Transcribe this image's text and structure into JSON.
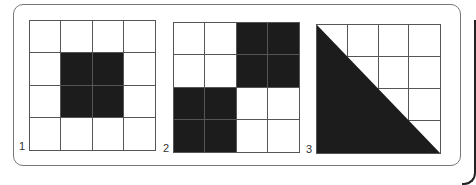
{
  "figures": [
    {
      "label": "1",
      "shaded": [
        [
          1,
          1
        ],
        [
          1,
          2
        ],
        [
          2,
          1
        ],
        [
          2,
          2
        ]
      ],
      "fill": "#1c1c1c"
    },
    {
      "label": "2",
      "shaded": [
        [
          0,
          2
        ],
        [
          0,
          3
        ],
        [
          1,
          2
        ],
        [
          1,
          3
        ],
        [
          2,
          0
        ],
        [
          2,
          1
        ],
        [
          3,
          0
        ],
        [
          3,
          1
        ]
      ],
      "fill": "#1c1c1c"
    },
    {
      "label": "3",
      "shape": "lower-left-triangle",
      "fill": "#1c1c1c"
    }
  ],
  "grid": {
    "rows": 4,
    "cols": 4
  }
}
